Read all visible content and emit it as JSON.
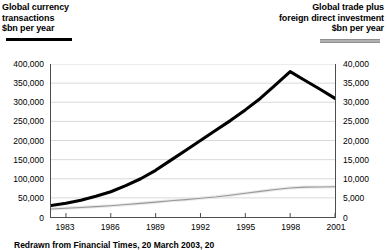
{
  "left_header": {
    "line1": "Global currency",
    "line2": "transactions",
    "line3": "$bn per year"
  },
  "right_header": {
    "line1": "Global trade plus",
    "line2": "foreign direct investment",
    "line3": "$bn per year"
  },
  "source_note": "Redrawn from Financial Times, 20 March 2003, 20",
  "colors": {
    "currency_line": "#000000",
    "trade_line": "#9a9a9a",
    "grid": "#d9d9d9",
    "axis": "#4d4d4d"
  },
  "chart_data": {
    "type": "line",
    "title": "",
    "subtitle": "",
    "xlabel": "",
    "grid": true,
    "legend": "inline-headers",
    "x": [
      1982,
      1983,
      1984,
      1985,
      1986,
      1987,
      1988,
      1989,
      1990,
      1991,
      1992,
      1993,
      1994,
      1995,
      1996,
      1997,
      1998,
      1999,
      2000,
      2001
    ],
    "xlim": [
      1982,
      2001
    ],
    "xticks": [
      "1983",
      "1986",
      "1989",
      "1992",
      "1995",
      "1998",
      "2001"
    ],
    "xtick_values": [
      1983,
      1986,
      1989,
      1992,
      1995,
      1998,
      2001
    ],
    "axes": [
      {
        "id": "left",
        "label": "Global currency transactions $bn per year",
        "ylim": [
          0,
          400000
        ],
        "yticks": [
          "0",
          "50,000",
          "100,000",
          "150,000",
          "200,000",
          "250,000",
          "300,000",
          "350,000",
          "400,000"
        ],
        "ytick_values": [
          0,
          50000,
          100000,
          150000,
          200000,
          250000,
          300000,
          350000,
          400000
        ]
      },
      {
        "id": "right",
        "label": "Global trade plus foreign direct investment $bn per year",
        "ylim": [
          0,
          40000
        ],
        "yticks": [
          "0",
          "5,000",
          "10,000",
          "15,000",
          "20,000",
          "25,000",
          "30,000",
          "35,000",
          "40,000"
        ],
        "ytick_values": [
          0,
          5000,
          10000,
          15000,
          20000,
          25000,
          30000,
          35000,
          40000
        ]
      }
    ],
    "series": [
      {
        "name": "Global currency transactions",
        "axis": "left",
        "color": "#000000",
        "values": [
          30000,
          36000,
          44000,
          54000,
          66000,
          82000,
          100000,
          122000,
          148000,
          174000,
          200000,
          226000,
          252000,
          280000,
          310000,
          345000,
          380000,
          357000,
          334000,
          310000
        ]
      },
      {
        "name": "Global trade plus foreign direct investment",
        "axis": "right",
        "color": "#9a9a9a",
        "values": [
          2100,
          2300,
          2500,
          2700,
          2950,
          3250,
          3550,
          3900,
          4250,
          4550,
          4900,
          5250,
          5700,
          6200,
          6700,
          7200,
          7600,
          7800,
          7850,
          7900
        ]
      }
    ]
  }
}
